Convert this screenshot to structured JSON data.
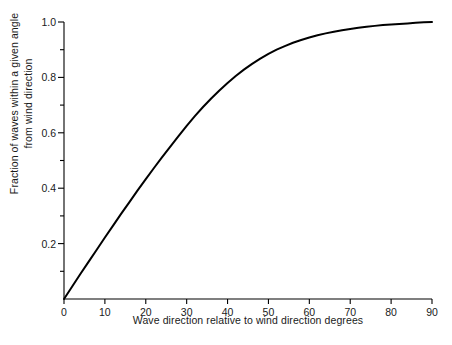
{
  "chart_data": {
    "type": "line",
    "title": "",
    "xlabel": "Wave direction relative to wind direction degrees",
    "ylabel_line1": "Fraction of waves within a given angle",
    "ylabel_line2": "from wind direction",
    "xlim": [
      0,
      90
    ],
    "ylim": [
      0,
      1.0
    ],
    "grid": false,
    "legend": "none",
    "xticks": [
      0,
      10,
      20,
      30,
      40,
      50,
      60,
      70,
      80,
      90
    ],
    "xtick_labels": [
      "0",
      "10",
      "20",
      "30",
      "40",
      "50",
      "60",
      "70",
      "80",
      "90"
    ],
    "yticks": [
      0.2,
      0.4,
      0.6,
      0.8,
      1.0
    ],
    "ytick_labels": [
      "0.2",
      "0.4",
      "0.6",
      "0.8",
      "1.0"
    ],
    "yminor_ticks": [
      0.1,
      0.3,
      0.5,
      0.7,
      0.9
    ],
    "line_color": "#000000",
    "background_color": "#ffffff",
    "series": [
      {
        "name": "Fraction of waves within angle",
        "x": [
          0,
          2,
          4,
          6,
          8,
          10,
          12,
          14,
          16,
          18,
          20,
          22,
          24,
          26,
          28,
          30,
          32,
          34,
          36,
          38,
          40,
          42,
          44,
          46,
          48,
          50,
          52,
          54,
          56,
          58,
          60,
          62,
          64,
          66,
          68,
          70,
          72,
          74,
          76,
          78,
          80,
          82,
          84,
          86,
          88,
          90
        ],
        "y": [
          0.0,
          0.045,
          0.09,
          0.134,
          0.178,
          0.222,
          0.265,
          0.308,
          0.35,
          0.392,
          0.433,
          0.473,
          0.512,
          0.55,
          0.588,
          0.625,
          0.66,
          0.693,
          0.724,
          0.753,
          0.78,
          0.805,
          0.828,
          0.849,
          0.868,
          0.885,
          0.9,
          0.913,
          0.925,
          0.935,
          0.944,
          0.952,
          0.959,
          0.965,
          0.97,
          0.975,
          0.979,
          0.983,
          0.986,
          0.989,
          0.991,
          0.993,
          0.995,
          0.997,
          0.999,
          1.0
        ]
      }
    ]
  }
}
